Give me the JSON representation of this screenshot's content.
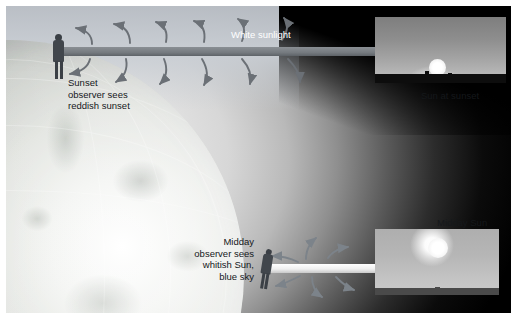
{
  "scene": {
    "beams": {
      "sunset_beam_label": "White sunlight",
      "midday_beam_label": ""
    },
    "labels": {
      "white_sunlight": "White sunlight",
      "sunset_observer": "Sunset\nobserver sees\nreddish sunset",
      "midday_observer": "Midday\nobserver sees\nwhitish Sun,\nblue sky"
    },
    "observers": [
      {
        "name": "sunset-observer",
        "position": "limb / terminator",
        "sees": "reddish sunset"
      },
      {
        "name": "midday-observer",
        "position": "sub-solar point",
        "sees": "whitish Sun, blue sky"
      }
    ],
    "earth": {
      "label": "Earth",
      "lit_side": "right"
    },
    "space_background": "#000000"
  },
  "insets": [
    {
      "name": "sun-at-sunset-photo",
      "caption": "Sun at sunset",
      "caption_position": "below"
    },
    {
      "name": "midday-sun-photo",
      "caption": "Midday Sun",
      "caption_position": "above"
    }
  ],
  "captions": {
    "sun_at_sunset": "Sun at sunset",
    "midday_sun": "Midday Sun"
  },
  "colors": {
    "space": "#000000",
    "beam": "#ffffff",
    "arrow": "#6b7076",
    "text_dark": "#15181b",
    "text_light": "#ffffff"
  }
}
